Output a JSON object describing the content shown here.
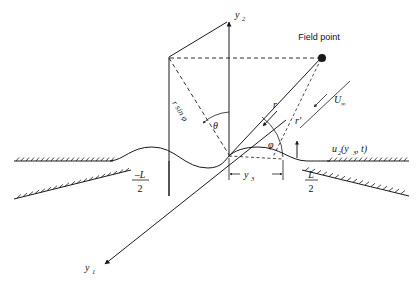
{
  "figure": {
    "background_color": "#ffffff",
    "line_color": "#1a1a1a",
    "width": 417,
    "height": 285
  },
  "labels": {
    "axis_y2": "y",
    "axis_y2_sub": "2",
    "axis_y1": "y",
    "axis_y1_sub": "1",
    "field_point": "Field point",
    "r": "r",
    "r_prime": "r'",
    "r_sin_phi": "r sin φ",
    "theta": "θ",
    "phi": "φ",
    "u_infinity": "U",
    "u_infinity_sub": "∞",
    "surface_disp": "u",
    "surface_disp_sub": "2",
    "surface_disp_args": "(y",
    "surface_disp_args_sub": "3",
    "surface_disp_args_tail": ", t)",
    "y3": "y",
    "y3_sub": "3",
    "neg_half_L_num": "–L",
    "neg_half_L_den": "2",
    "half_L_num": "L",
    "half_L_den": "2"
  },
  "geometry": {
    "origin": {
      "x": 229,
      "y": 156
    },
    "field_point": {
      "x": 322,
      "y": 58
    },
    "y2_axis_tip": {
      "x": 229,
      "y": 20
    },
    "y1_axis_tip": {
      "x": 101,
      "y": 266
    },
    "plane_top_left": {
      "x": 169,
      "y": 57
    },
    "plane_bottom_left": {
      "x": 169,
      "y": 196
    },
    "baseline_y": 161,
    "wave_amplitude": 8,
    "wave_left_x": 110,
    "wave_right_x": 330,
    "y3_dim_left": {
      "x": 229,
      "y": 174
    },
    "y3_dim_right": {
      "x": 283,
      "y": 174
    },
    "normal_arrow": {
      "x": 297,
      "y": 143
    }
  }
}
